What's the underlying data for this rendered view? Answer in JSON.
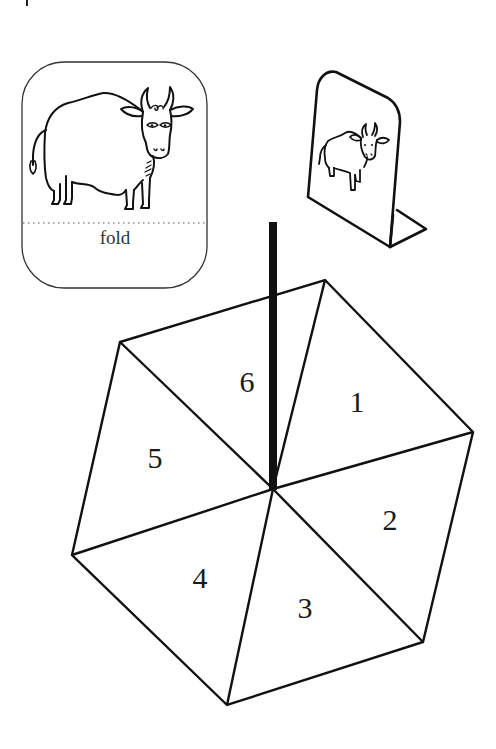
{
  "figure": {
    "stroke_color": "#111111",
    "background": "#ffffff"
  },
  "fold_card": {
    "label": "fold",
    "picture": "bull",
    "box": {
      "x": 22,
      "y": 62,
      "w": 185,
      "h": 226,
      "radius": 42
    },
    "fold_line_y": 223
  },
  "standing_card": {
    "picture": "bull",
    "description": "card folded along dotted line to stand upright"
  },
  "spinner": {
    "center": {
      "x": 273,
      "y": 489
    },
    "vertices": [
      {
        "x": 325,
        "y": 280
      },
      {
        "x": 473,
        "y": 432
      },
      {
        "x": 423,
        "y": 642
      },
      {
        "x": 227,
        "y": 705
      },
      {
        "x": 72,
        "y": 555
      },
      {
        "x": 120,
        "y": 342
      }
    ],
    "stick": {
      "x": 273,
      "top": 222,
      "bottom": 489,
      "width": 8
    },
    "sections": [
      {
        "label": "1",
        "x": 357,
        "y": 402
      },
      {
        "label": "2",
        "x": 390,
        "y": 520
      },
      {
        "label": "3",
        "x": 305,
        "y": 608
      },
      {
        "label": "4",
        "x": 200,
        "y": 578
      },
      {
        "label": "5",
        "x": 155,
        "y": 458
      },
      {
        "label": "6",
        "x": 247,
        "y": 382
      }
    ]
  }
}
